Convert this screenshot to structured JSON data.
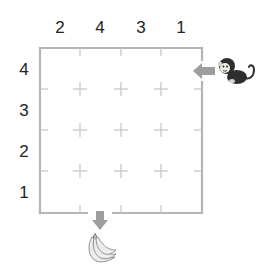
{
  "puzzle": {
    "type": "skyscraper-maze",
    "grid_size": 4,
    "column_clues": [
      "2",
      "4",
      "3",
      "1"
    ],
    "row_clues": [
      "4",
      "3",
      "2",
      "1"
    ],
    "entry": {
      "side": "right",
      "row": 1,
      "label": "monkey"
    },
    "exit": {
      "side": "bottom",
      "column": 2,
      "label": "banana"
    },
    "colors": {
      "border": "#b5b5b5",
      "cross": "#bdbdbd",
      "arrow": "#9e9e9e",
      "text": "#222222"
    }
  },
  "icons": {
    "entry_character": "monkey-icon",
    "exit_goal": "banana-icon",
    "entry_arrow": "arrow-left-icon",
    "exit_arrow": "arrow-down-icon"
  }
}
